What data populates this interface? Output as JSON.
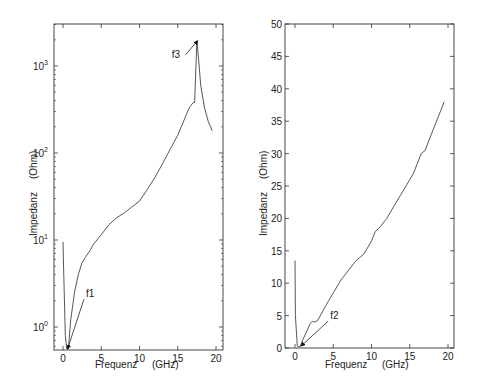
{
  "chart_data": [
    {
      "type": "line",
      "title": "",
      "xlabel": "Frequenz",
      "xunit": "(GHz)",
      "ylabel": "Impedanz",
      "yunit": "(Ohm)",
      "yscale": "log",
      "xlim": [
        -1,
        21
      ],
      "ylim": [
        0.55,
        3000
      ],
      "xticks": [
        0,
        5,
        10,
        15,
        20
      ],
      "xtick_labels": [
        "0",
        "5",
        "10",
        "15",
        "20"
      ],
      "yticks": [
        1,
        10,
        100,
        1000
      ],
      "ytick_labels": [
        {
          "base": "10",
          "exp": "0"
        },
        {
          "base": "10",
          "exp": "1"
        },
        {
          "base": "10",
          "exp": "2"
        },
        {
          "base": "10",
          "exp": "3"
        }
      ],
      "grid": false,
      "series": [
        {
          "name": "Impedanz",
          "x": [
            0.0,
            0.05,
            0.3,
            0.5,
            0.7,
            1.0,
            1.5,
            2.0,
            2.5,
            3.0,
            3.5,
            4.0,
            5.0,
            6.0,
            7.0,
            8.0,
            9.0,
            10.0,
            11.0,
            12.0,
            13.0,
            14.0,
            15.0,
            16.0,
            16.5,
            17.0,
            17.2,
            17.5,
            17.8,
            18.0,
            18.5,
            19.0,
            19.5
          ],
          "y": [
            9.5,
            6.0,
            0.8,
            0.56,
            0.56,
            1.2,
            2.5,
            4.0,
            5.5,
            6.5,
            7.5,
            9.0,
            11.5,
            15.0,
            18.0,
            20.5,
            24.0,
            28.0,
            38.0,
            52.0,
            75.0,
            110.0,
            160.0,
            260.0,
            330.0,
            380.0,
            380.0,
            1950.0,
            1000.0,
            600.0,
            330.0,
            230.0,
            180.0
          ]
        }
      ],
      "annotations": [
        {
          "text": "f1",
          "x": 0.6,
          "y": 0.56,
          "label_x": 3.0,
          "label_y": 1.6
        },
        {
          "text": "f3",
          "x": 17.6,
          "y": 1950,
          "label_x": 14.2,
          "label_y": 1250
        }
      ]
    },
    {
      "type": "line",
      "title": "",
      "xlabel": "Frequenz",
      "xunit": "(GHz)",
      "ylabel": "Impedanz",
      "yunit": "(Ohm)",
      "yscale": "linear",
      "xlim": [
        -1,
        21
      ],
      "ylim": [
        0,
        50
      ],
      "xticks": [
        0,
        5,
        10,
        15,
        20
      ],
      "xtick_labels": [
        "0",
        "5",
        "10",
        "15",
        "20"
      ],
      "yticks": [
        0,
        5,
        10,
        15,
        20,
        25,
        30,
        35,
        40,
        45,
        50
      ],
      "ytick_labels": [
        "0",
        "5",
        "10",
        "15",
        "20",
        "25",
        "30",
        "35",
        "40",
        "45",
        "50"
      ],
      "grid": false,
      "series": [
        {
          "name": "Impedanz",
          "x": [
            0.0,
            0.05,
            0.3,
            0.5,
            0.7,
            1.0,
            1.5,
            2.0,
            2.3,
            2.6,
            3.0,
            4.0,
            5.0,
            6.0,
            7.0,
            8.0,
            9.0,
            10.0,
            10.5,
            11.0,
            12.0,
            13.0,
            14.0,
            15.0,
            15.5,
            16.0,
            16.5,
            17.0,
            17.5,
            18.0,
            18.5,
            19.0,
            19.5
          ],
          "y": [
            13.5,
            5.0,
            0.3,
            0.2,
            0.3,
            1.2,
            2.5,
            3.8,
            4.1,
            4.0,
            4.3,
            6.5,
            8.5,
            10.5,
            12.0,
            13.5,
            14.5,
            16.5,
            18.0,
            18.5,
            20.0,
            22.0,
            24.0,
            26.0,
            27.0,
            28.5,
            30.0,
            30.5,
            32.0,
            33.5,
            35.0,
            36.5,
            38.0
          ]
        }
      ],
      "annotations": [
        {
          "text": "f2",
          "x": 0.8,
          "y": 0.3,
          "label_x": 4.6,
          "label_y": 2.6
        }
      ]
    }
  ],
  "charts": [
    {
      "xlabel": "Frequenz",
      "xunit": "(GHz)",
      "ylabel": "Impedanz",
      "yunit": "(Ohm)",
      "annot": [
        "f1",
        "f3"
      ]
    },
    {
      "xlabel": "Frequenz",
      "xunit": "(GHz)",
      "ylabel": "Impedanz",
      "yunit": "(Ohm)",
      "annot": [
        "f2"
      ]
    }
  ]
}
